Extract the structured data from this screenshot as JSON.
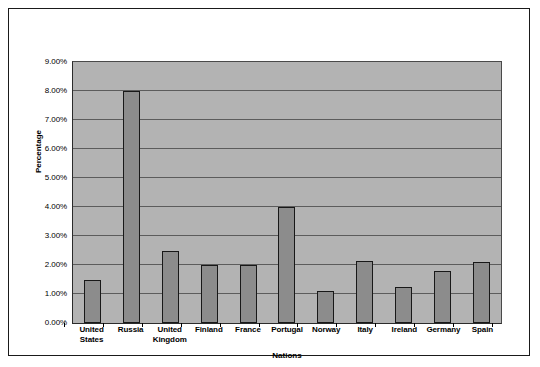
{
  "chart_data": {
    "type": "bar",
    "title": "",
    "xlabel": "Nations",
    "ylabel": "Percentage",
    "categories": [
      "United States",
      "Russia",
      "United Kingdom",
      "Finland",
      "France",
      "Portugal",
      "Norway",
      "Italy",
      "Ireland",
      "Germany",
      "Spain"
    ],
    "values": [
      1.5,
      8.0,
      2.5,
      2.0,
      2.0,
      4.0,
      1.1,
      2.15,
      1.25,
      1.8,
      2.1
    ],
    "ylim": [
      0,
      9
    ],
    "ytick_values": [
      0,
      1,
      2,
      3,
      4,
      5,
      6,
      7,
      8,
      9
    ],
    "ytick_labels": [
      "0.00%",
      "1.00%",
      "2.00%",
      "3.00%",
      "4.00%",
      "5.00%",
      "6.00%",
      "7.00%",
      "8.00%",
      "9.00%"
    ],
    "grid": true,
    "legend": false,
    "colors": {
      "bar_fill": "#8c8c8c",
      "bar_edge": "#181818",
      "plot_background": "#b3b3b3",
      "gridline": "#5c5c5c",
      "frame": "#1a1a1a",
      "text": "#000000",
      "figure_background": "#ffffff"
    }
  }
}
